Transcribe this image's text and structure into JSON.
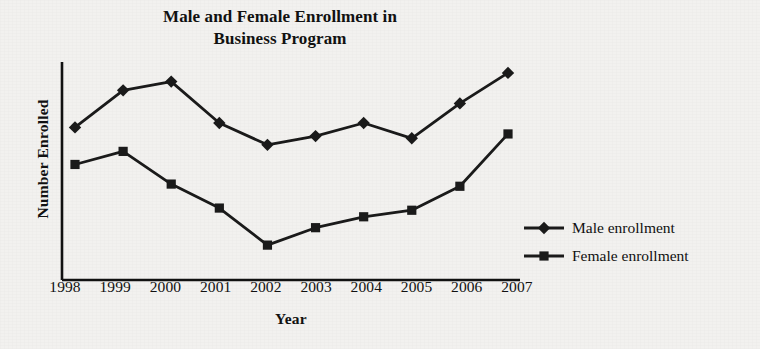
{
  "chart_data": {
    "type": "line",
    "title": "Male and Female Enrollment in Business Program",
    "title_line1": "Male and Female Enrollment in",
    "title_line2": "Business Program",
    "xlabel": "Year",
    "ylabel": "Number Enrolled",
    "categories": [
      "1998",
      "1999",
      "2000",
      "2001",
      "2002",
      "2003",
      "2004",
      "2005",
      "2006",
      "2007"
    ],
    "x": [
      1998,
      1999,
      2000,
      2001,
      2002,
      2003,
      2004,
      2005,
      2006,
      2007
    ],
    "ylim": [
      0,
      100
    ],
    "y_tick_labels": [],
    "grid": false,
    "legend_position": "right",
    "series": [
      {
        "name": "Male enrollment",
        "marker": "diamond",
        "color": "#1a1a1a",
        "values": [
          70,
          87,
          91,
          72,
          62,
          66,
          72,
          65,
          81,
          95
        ]
      },
      {
        "name": "Female enrollment",
        "marker": "square",
        "color": "#1a1a1a",
        "values": [
          53,
          59,
          44,
          33,
          16,
          24,
          29,
          32,
          43,
          67
        ]
      }
    ]
  },
  "legend": {
    "items": [
      {
        "label": "Male enrollment",
        "marker": "diamond"
      },
      {
        "label": "Female enrollment",
        "marker": "square"
      }
    ]
  },
  "colors": {
    "background": "#f2f1ef",
    "ink": "#1a1a1a",
    "axis": "#111111"
  }
}
